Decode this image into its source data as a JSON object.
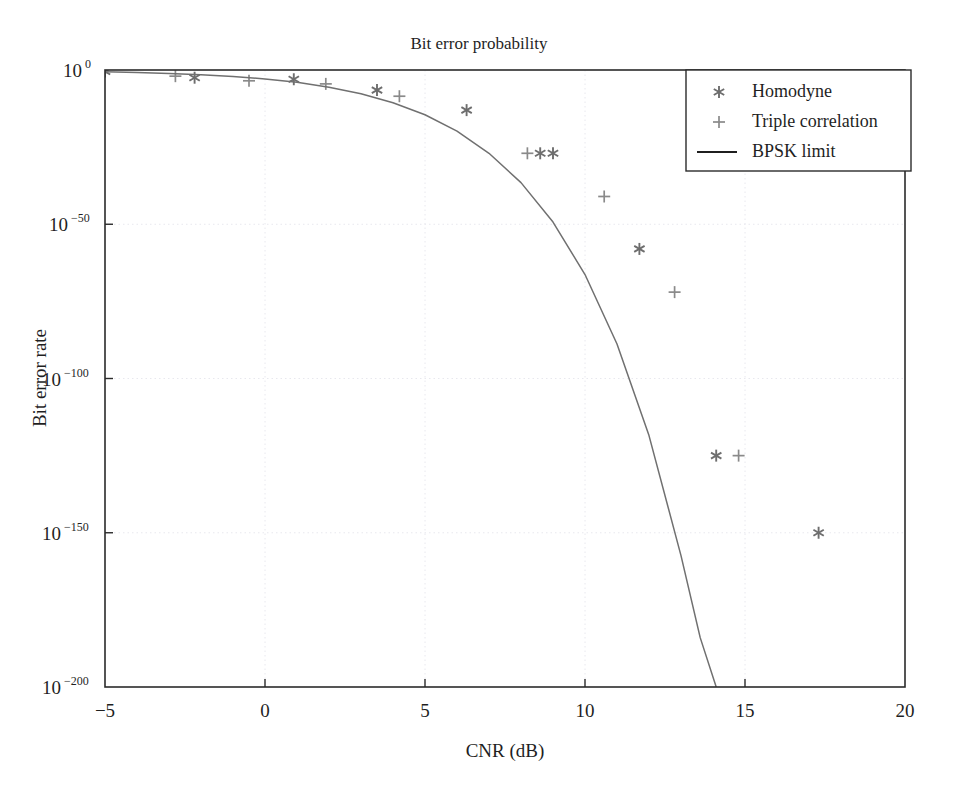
{
  "chart_data": {
    "type": "scatter",
    "title": "Bit error probability",
    "xlabel": "CNR (dB)",
    "ylabel": "Bit error rate",
    "xlim": [
      -5,
      20
    ],
    "ylim_exponent": [
      -200,
      0
    ],
    "yscale": "log",
    "grid": true,
    "legend_position": "top-right",
    "xticks": [
      "−5",
      "0",
      "5",
      "10",
      "15",
      "20"
    ],
    "xtick_values": [
      -5,
      0,
      5,
      10,
      15,
      20
    ],
    "ytick_labels": [
      "10^0",
      "10^-50",
      "10^-100",
      "10^-150",
      "10^-200"
    ],
    "ytick_mantissa": "10",
    "ytick_exponents": [
      "0",
      "−50",
      "−100",
      "−150",
      "−200"
    ],
    "ytick_values": [
      0,
      -50,
      -100,
      -150,
      -200
    ],
    "series": [
      {
        "name": "Homodyne",
        "marker": "asterisk",
        "color": "#6e6e6e",
        "points": [
          {
            "x": -5.0,
            "y_exp": -0.5
          },
          {
            "x": -2.2,
            "y_exp": -2.5
          },
          {
            "x": 0.9,
            "y_exp": -3.0
          },
          {
            "x": 3.5,
            "y_exp": -6.5
          },
          {
            "x": 6.3,
            "y_exp": -13.0
          },
          {
            "x": 8.6,
            "y_exp": -27.0
          },
          {
            "x": 9.0,
            "y_exp": -27.0
          },
          {
            "x": 11.7,
            "y_exp": -58.0
          },
          {
            "x": 14.1,
            "y_exp": -125.0
          },
          {
            "x": 17.3,
            "y_exp": -150.0
          }
        ]
      },
      {
        "name": "Triple correlation",
        "marker": "plus",
        "color": "#8a8a8a",
        "points": [
          {
            "x": -2.8,
            "y_exp": -2.0
          },
          {
            "x": -0.5,
            "y_exp": -3.5
          },
          {
            "x": 1.9,
            "y_exp": -4.5
          },
          {
            "x": 4.2,
            "y_exp": -8.5
          },
          {
            "x": 8.2,
            "y_exp": -27.0
          },
          {
            "x": 10.6,
            "y_exp": -41.0
          },
          {
            "x": 12.8,
            "y_exp": -72.0
          },
          {
            "x": 14.8,
            "y_exp": -125.0
          }
        ]
      },
      {
        "name": "BPSK limit",
        "marker": "line",
        "color": "#707070",
        "description": "Theoretical BPSK bit error rate limit, decreasing monotonically from near 1 at −5 dB to below 10^-200 near 14.5 dB",
        "points": [
          {
            "x": -5.0,
            "y_exp": -0.6
          },
          {
            "x": -4.0,
            "y_exp": -0.8
          },
          {
            "x": -3.0,
            "y_exp": -1.1
          },
          {
            "x": -2.0,
            "y_exp": -1.5
          },
          {
            "x": -1.0,
            "y_exp": -2.1
          },
          {
            "x": 0.0,
            "y_exp": -2.9
          },
          {
            "x": 1.0,
            "y_exp": -4.0
          },
          {
            "x": 2.0,
            "y_exp": -5.6
          },
          {
            "x": 3.0,
            "y_exp": -7.7
          },
          {
            "x": 4.0,
            "y_exp": -10.6
          },
          {
            "x": 5.0,
            "y_exp": -14.5
          },
          {
            "x": 6.0,
            "y_exp": -19.8
          },
          {
            "x": 7.0,
            "y_exp": -27.0
          },
          {
            "x": 8.0,
            "y_exp": -36.5
          },
          {
            "x": 9.0,
            "y_exp": -49.3
          },
          {
            "x": 10.0,
            "y_exp": -66.3
          },
          {
            "x": 11.0,
            "y_exp": -88.8
          },
          {
            "x": 12.0,
            "y_exp": -118.5
          },
          {
            "x": 13.0,
            "y_exp": -157.4
          },
          {
            "x": 13.6,
            "y_exp": -184.0
          },
          {
            "x": 14.1,
            "y_exp": -200.0
          },
          {
            "x": 14.5,
            "y_exp": -208.0
          }
        ]
      }
    ]
  },
  "legend": {
    "items": [
      {
        "label": "Homodyne",
        "marker": "asterisk"
      },
      {
        "label": "Triple correlation",
        "marker": "plus"
      },
      {
        "label": "BPSK limit",
        "marker": "line"
      }
    ]
  },
  "colors": {
    "axis": "#2b2b2b",
    "grid": "#e8e8ee",
    "curve": "#707070",
    "marker_homodyne": "#6e6e6e",
    "marker_triple": "#8a8a8a",
    "background": "#ffffff"
  }
}
